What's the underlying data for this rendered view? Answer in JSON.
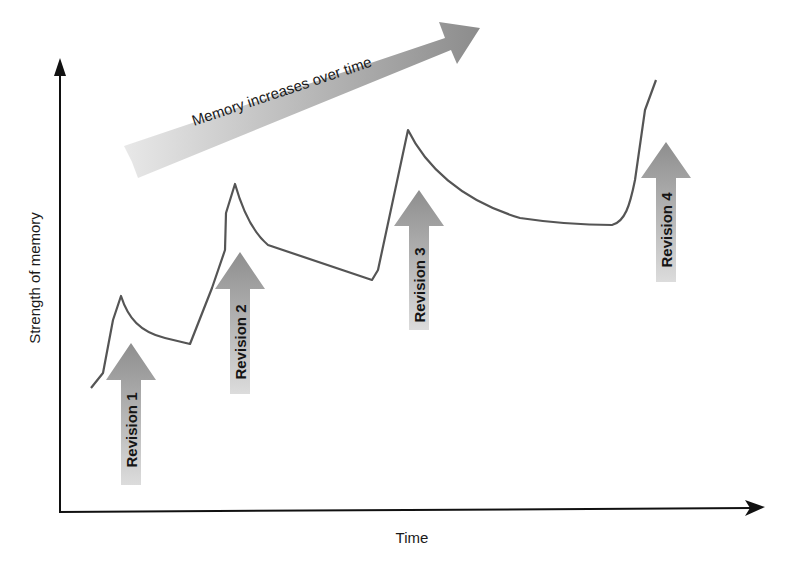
{
  "diagram": {
    "y_axis_label": "Strength of memory",
    "x_axis_label": "Time",
    "trend_arrow_label": "Memory increases over time",
    "revisions": [
      {
        "label": "Revision 1"
      },
      {
        "label": "Revision 2"
      },
      {
        "label": "Revision 3"
      },
      {
        "label": "Revision 4"
      }
    ],
    "colors": {
      "axis": "#111111",
      "curve": "#555555",
      "arrow_dark": "#8a8a8a",
      "arrow_light": "#e6e6e6"
    }
  }
}
